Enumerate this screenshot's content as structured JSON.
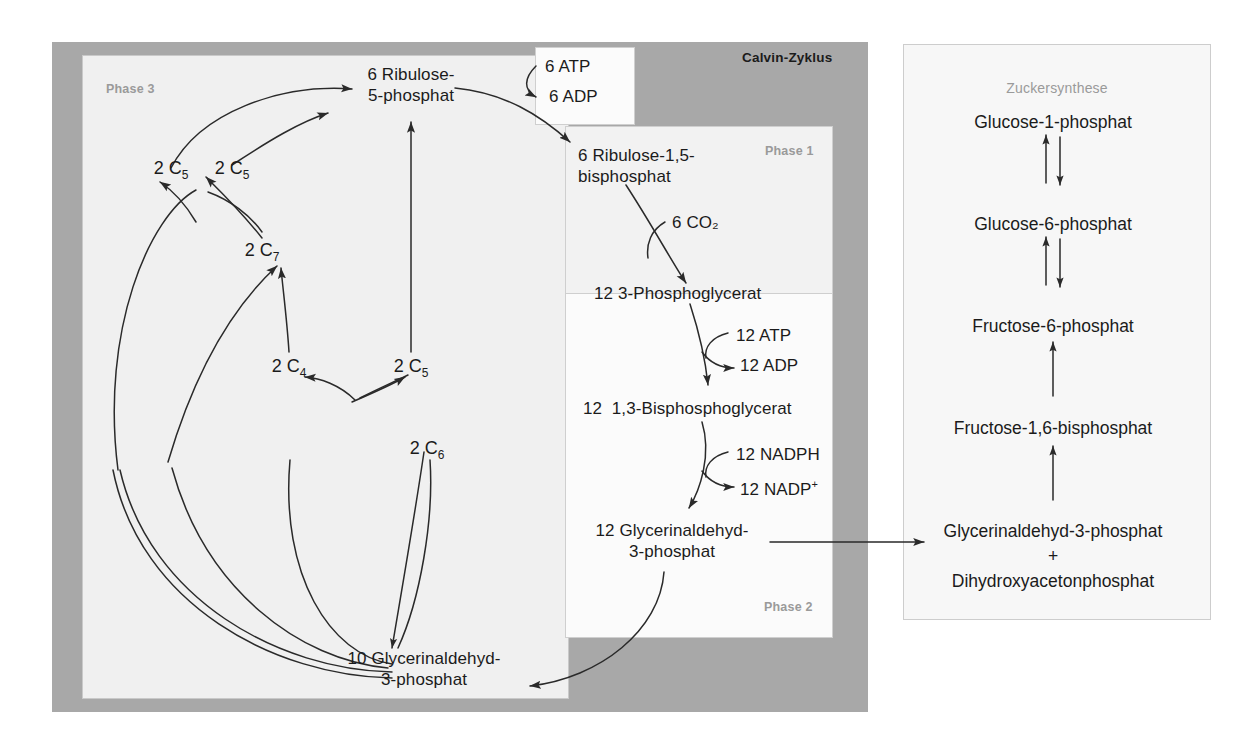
{
  "diagram": {
    "title": "Calvin-Zyklus",
    "phase_labels": {
      "phase3": "Phase 3",
      "phase1": "Phase 1",
      "phase2": "Phase 2"
    },
    "sugar_panel_title": "Zuckersynthese"
  },
  "phase1": {
    "rubp": "6 Ribulose-1,5-\nbisphosphat",
    "co2": "6 CO₂",
    "pga": "12 3-Phosphoglycerat"
  },
  "phase2": {
    "atp": "12 ATP",
    "adp": "12 ADP",
    "bpg": "12  1,3-Bisphosphoglycerat",
    "nadph": "12 NADPH",
    "nadp_plus": "12 NADP",
    "nadp_plus_sup": "+",
    "gap": "12 Glycerinaldehyd-\n3-phosphat"
  },
  "phase3": {
    "ru5p": "6 Ribulose-\n5-phosphat",
    "atp": "6 ATP",
    "adp": "6 ADP",
    "gap10": "10 Glycerinaldehyd-\n3-phosphat",
    "nodes": [
      {
        "name": "c5-upper-left",
        "prefix": "2 C",
        "sub": "5"
      },
      {
        "name": "c5-upper-mid",
        "prefix": "2 C",
        "sub": "5"
      },
      {
        "name": "c7",
        "prefix": "2 C",
        "sub": "7"
      },
      {
        "name": "c4",
        "prefix": "2 C",
        "sub": "4"
      },
      {
        "name": "c5-lower",
        "prefix": "2 C",
        "sub": "5"
      },
      {
        "name": "c6",
        "prefix": "2 C",
        "sub": "6"
      }
    ]
  },
  "sugar_synthesis": {
    "steps": [
      "Glucose-1-phosphat",
      "Glucose-6-phosphat",
      "Fructose-6-phosphat",
      "Fructose-1,6-bisphosphat",
      "Glycerinaldehyd-3-phosphat",
      "+",
      "Dihydroxyacetonphosphat"
    ]
  },
  "colors": {
    "page_background": "#ffffff",
    "calvin_frame": "#a8a8a8",
    "phase3_panel": "#f0f0f0",
    "phase1_panel": "#f2f2f2",
    "phase2_panel": "#fbfbfb",
    "sugar_panel": "#f7f7f7",
    "text": "#1b1b1b",
    "muted_text": "#9a9a9a",
    "arrow": "#2a2a2a"
  }
}
